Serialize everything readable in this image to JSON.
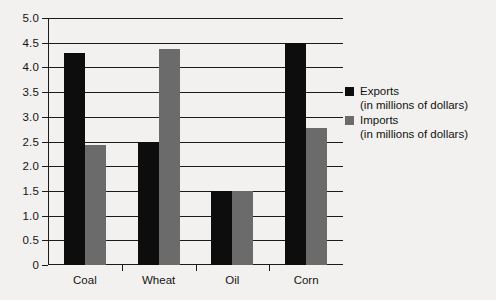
{
  "chart_data": {
    "type": "bar",
    "title": "",
    "subtitle": "",
    "xlabel": "",
    "ylabel": "",
    "categories": [
      "Coal",
      "Wheat",
      "Oil",
      "Corn"
    ],
    "series": [
      {
        "name": "Exports",
        "sublabel": "(in millions of dollars)",
        "color": "#0d0d0d",
        "values": [
          4.3,
          2.5,
          1.5,
          4.5
        ]
      },
      {
        "name": "Imports",
        "sublabel": "(in millions of dollars)",
        "color": "#6b6b6b",
        "values": [
          2.43,
          4.38,
          1.5,
          2.78
        ]
      }
    ],
    "ylim": [
      0,
      5.0
    ],
    "ytick_labels": [
      "0",
      "0.5",
      "1.0",
      "1.5",
      "2.0",
      "2.5",
      "3.0",
      "3.5",
      "4.0",
      "4.5",
      "5.0"
    ],
    "ytick_values": [
      0,
      0.5,
      1.0,
      1.5,
      2.0,
      2.5,
      3.0,
      3.5,
      4.0,
      4.5,
      5.0
    ],
    "grid": true,
    "legend_position": "right",
    "background_color": "#f2f1ef"
  }
}
